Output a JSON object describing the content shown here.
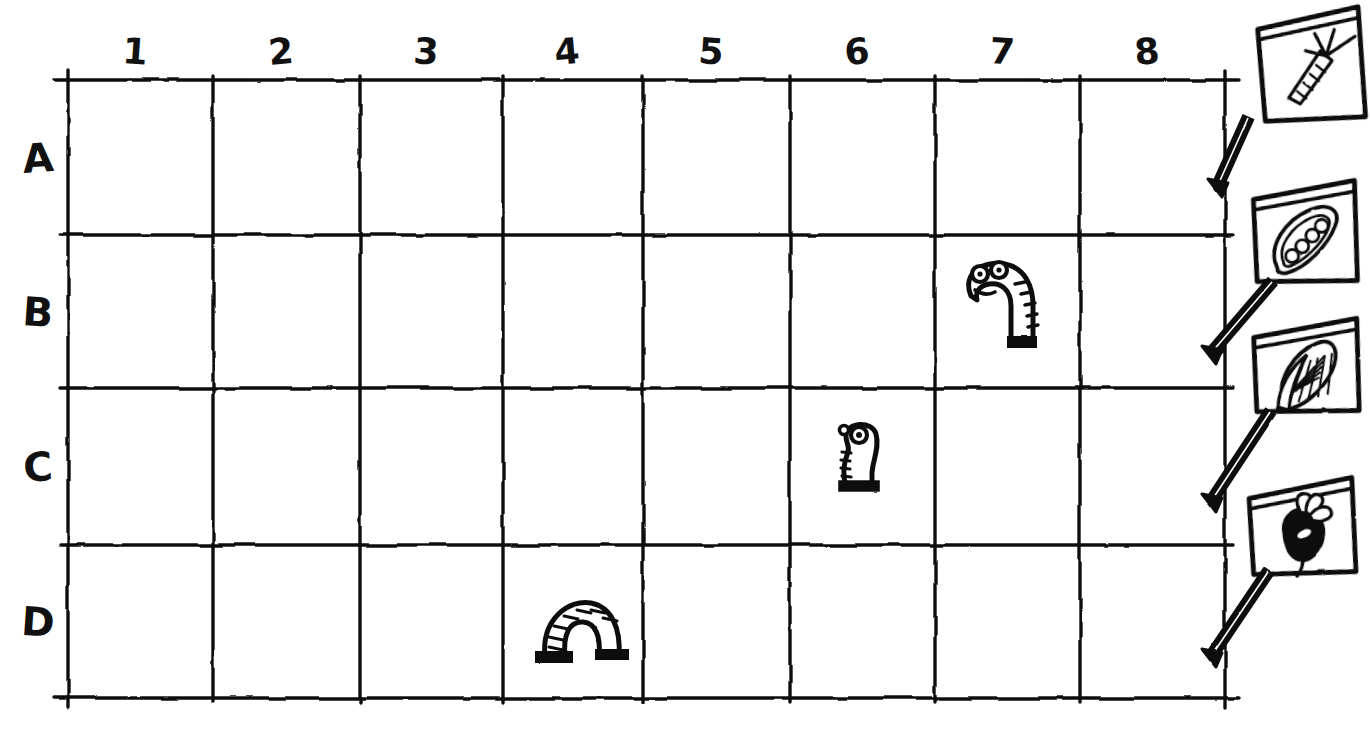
{
  "scene": {
    "title": "Garden plot grid with worms and seed packets",
    "style": "hand-drawn ink on white paper",
    "ink_color": "#111111",
    "paper_color": "#ffffff"
  },
  "grid": {
    "columns": [
      "1",
      "2",
      "3",
      "4",
      "5",
      "6",
      "7",
      "8"
    ],
    "rows": [
      "A",
      "B",
      "C",
      "D"
    ],
    "column_count": 8,
    "row_count": 4,
    "left": 68,
    "right": 1225,
    "top": 80,
    "bottom": 698,
    "column_lines": [
      68,
      213,
      360,
      503,
      643,
      790,
      935,
      1080,
      1225
    ],
    "row_lines": [
      80,
      235,
      388,
      545,
      698
    ]
  },
  "worms": [
    {
      "name": "standing-worm",
      "cell": "B7",
      "col": 7,
      "row": "B",
      "pose": "upright-segmented-head-bent-left",
      "eyes": 2,
      "x": 955,
      "y": 258,
      "w": 100,
      "h": 100
    },
    {
      "name": "small-worm",
      "cell": "C6",
      "col": 6,
      "row": "C",
      "pose": "upright-short-facing-left",
      "eyes": 1,
      "x": 828,
      "y": 418,
      "w": 62,
      "h": 80
    },
    {
      "name": "arch-worm",
      "cell": "D4",
      "col": 4,
      "row": "D",
      "pose": "arched-inverted-u-segmented",
      "eyes": 0,
      "x": 535,
      "y": 595,
      "w": 92,
      "h": 68
    }
  ],
  "seed_packets": [
    {
      "name": "carrot-packet",
      "crop": "carrot",
      "order": 1,
      "x": 1258,
      "y": 8,
      "w": 108,
      "h": 118,
      "rotate": -6,
      "stake_from_x": 1248,
      "stake_from_y": 118,
      "stake_to_x": 1218,
      "stake_to_y": 185
    },
    {
      "name": "pea-packet",
      "crop": "peas",
      "order": 2,
      "x": 1252,
      "y": 180,
      "w": 108,
      "h": 108,
      "rotate": -4,
      "stake_from_x": 1272,
      "stake_from_y": 282,
      "stake_to_x": 1212,
      "stake_to_y": 352
    },
    {
      "name": "corn-packet",
      "crop": "corn",
      "order": 3,
      "x": 1252,
      "y": 318,
      "w": 110,
      "h": 100,
      "rotate": -4,
      "stake_from_x": 1270,
      "stake_from_y": 412,
      "stake_to_x": 1212,
      "stake_to_y": 500
    },
    {
      "name": "beet-packet",
      "crop": "beet",
      "order": 4,
      "x": 1248,
      "y": 478,
      "w": 110,
      "h": 102,
      "rotate": -5,
      "stake_from_x": 1268,
      "stake_from_y": 572,
      "stake_to_x": 1212,
      "stake_to_y": 655
    }
  ]
}
